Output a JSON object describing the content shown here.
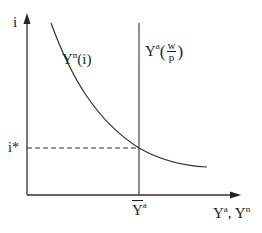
{
  "diagram": {
    "title": "",
    "colors": {
      "line": "#333333",
      "text": "#222222",
      "background": "#ffffff"
    },
    "axes": {
      "y_label": "i",
      "x_label_main": "Y",
      "x_label_sup_a": "a",
      "x_label_sep": ", ",
      "x_label_main2": "Y",
      "x_label_sup_n": "n"
    },
    "curves": {
      "demand": {
        "name": "Y",
        "sup": "n",
        "arg": "(i)",
        "shape": "downward-sloping convex curve"
      },
      "supply": {
        "name": "Y",
        "sup": "a",
        "open": "(",
        "frac_num": "w",
        "frac_den": "p",
        "close": ")",
        "shape": "vertical line"
      }
    },
    "equilibrium": {
      "rate_label": "i*",
      "output_label": "Y",
      "output_sup": "a",
      "output_overline": true
    }
  }
}
